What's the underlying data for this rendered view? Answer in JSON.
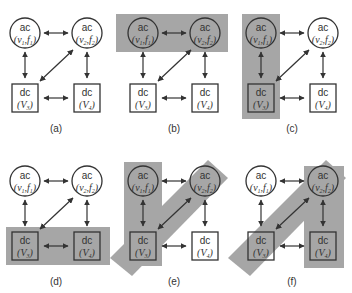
{
  "diagram": {
    "colors": {
      "highlight": "#a6a6a6",
      "stroke": "#333333",
      "background": "#ffffff"
    },
    "nodes": {
      "ac1": {
        "type": "ac",
        "label": "ac",
        "sub": "(ν1,f1)",
        "shape": "circle"
      },
      "ac2": {
        "type": "ac",
        "label": "ac",
        "sub": "(ν2,f2)",
        "shape": "circle"
      },
      "dc3": {
        "type": "dc",
        "label": "dc",
        "sub": "(V3)",
        "shape": "square"
      },
      "dc4": {
        "type": "dc",
        "label": "dc",
        "sub": "(V4)",
        "shape": "square"
      }
    },
    "edges": [
      {
        "from": "ac1",
        "to": "ac2",
        "bidirectional": true
      },
      {
        "from": "ac1",
        "to": "dc3",
        "bidirectional": true
      },
      {
        "from": "ac2",
        "to": "dc4",
        "bidirectional": true
      },
      {
        "from": "dc3",
        "to": "dc4",
        "bidirectional": true
      },
      {
        "from": "ac2",
        "to": "dc3",
        "bidirectional": true
      }
    ],
    "panels": [
      {
        "label": "(a)",
        "highlight": "none",
        "grouped": []
      },
      {
        "label": "(b)",
        "highlight": "top-row",
        "grouped": [
          "ac1",
          "ac2"
        ]
      },
      {
        "label": "(c)",
        "highlight": "left-column",
        "grouped": [
          "ac1",
          "dc3"
        ]
      },
      {
        "label": "(d)",
        "highlight": "bottom-row",
        "grouped": [
          "dc3",
          "dc4"
        ]
      },
      {
        "label": "(e)",
        "highlight": "left-column + diagonal",
        "grouped": [
          "ac1",
          "dc3",
          "ac2"
        ]
      },
      {
        "label": "(f)",
        "highlight": "diagonal + right-column",
        "grouped": [
          "dc3",
          "ac2",
          "dc4"
        ]
      }
    ]
  }
}
